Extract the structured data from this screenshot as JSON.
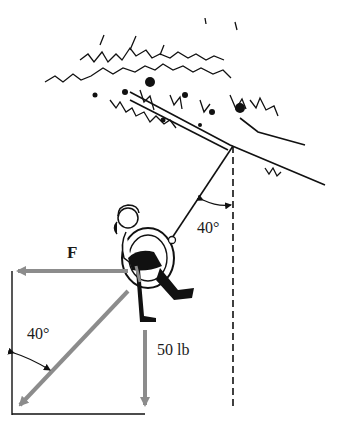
{
  "diagram": {
    "labels": {
      "force": "F",
      "weight": "50 lb",
      "rope_angle": "40°",
      "vector_angle": "40°"
    },
    "colors": {
      "vector_arrow": "#8c8c8c",
      "line": "#111111",
      "background": "#ffffff"
    }
  }
}
